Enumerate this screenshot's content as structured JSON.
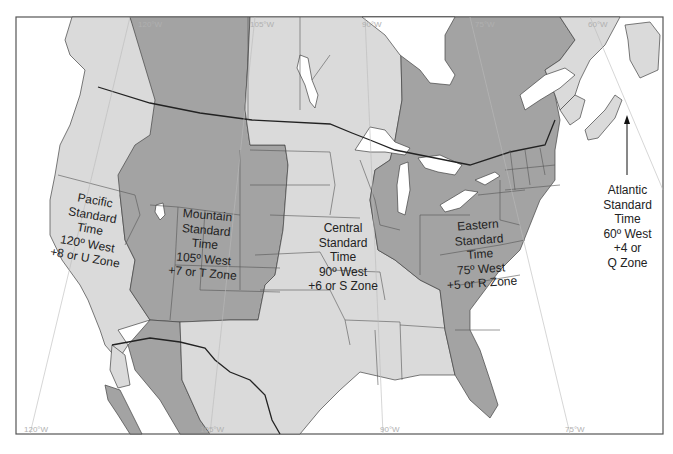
{
  "map": {
    "title": "North American Standard Time Zones",
    "colors": {
      "light_zone": "#dadada",
      "dark_zone": "#a3a3a3",
      "water": "#ffffff",
      "border": "#333333",
      "meridian": "#b8b8b8"
    },
    "zones": [
      {
        "id": "pacific",
        "lines": [
          "Pacific",
          "Standard",
          "Time",
          "120º West",
          "+8 or U Zone"
        ],
        "shade": "light"
      },
      {
        "id": "mountain",
        "lines": [
          "Mountain",
          "Standard",
          "Time",
          "105º West",
          "+7 or T Zone"
        ],
        "shade": "dark"
      },
      {
        "id": "central",
        "lines": [
          "Central",
          "Standard",
          "Time",
          "90º West",
          "+6 or S Zone"
        ],
        "shade": "light"
      },
      {
        "id": "eastern",
        "lines": [
          "Eastern",
          "Standard",
          "Time",
          "75º West",
          "+5 or R Zone"
        ],
        "shade": "dark"
      },
      {
        "id": "atlantic",
        "lines": [
          "Atlantic",
          "Standard",
          "Time",
          "60º West",
          "+4 or",
          "Q Zone"
        ],
        "shade": "light"
      }
    ],
    "meridians": {
      "top": [
        "120°W",
        "105°W",
        "90°W",
        "75°W",
        "60°W"
      ],
      "bottom": [
        "120°W",
        "105°W",
        "90°W",
        "75°W"
      ]
    }
  }
}
